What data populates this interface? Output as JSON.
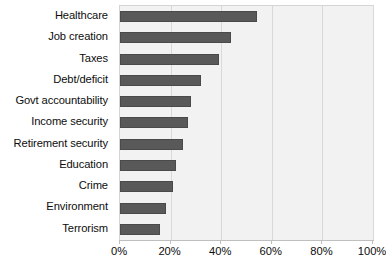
{
  "chart_data": {
    "type": "bar",
    "orientation": "horizontal",
    "title": "",
    "subtitle": "",
    "xlabel": "",
    "ylabel": "",
    "xlim": [
      0,
      100
    ],
    "xticks": [
      0,
      20,
      40,
      60,
      80,
      100
    ],
    "xtick_labels": [
      "0%",
      "20%",
      "40%",
      "60%",
      "80%",
      "100%"
    ],
    "grid": true,
    "grid_axis": "x",
    "legend": false,
    "legend_position": "none",
    "categories": [
      "Healthcare",
      "Job creation",
      "Taxes",
      "Debt/deficit",
      "Govt accountability",
      "Income security",
      "Retirement security",
      "Education",
      "Crime",
      "Environment",
      "Terrorism"
    ],
    "values": [
      54,
      44,
      39,
      32,
      28,
      27,
      25,
      22,
      21,
      18,
      16
    ],
    "series": [
      {
        "name": "",
        "values": [
          54,
          44,
          39,
          32,
          28,
          27,
          25,
          22,
          21,
          18,
          16
        ]
      }
    ]
  },
  "style": {
    "bar_color": "#595959",
    "bar_border_color": "#4a4a4a",
    "plot_background": "#f2f2f2",
    "plot_border": "#d4d4d4",
    "gridline_color": "#d9d9d9",
    "axis_color": "#bfbfbf",
    "text_color": "#0d0d0d",
    "page_background": "#ffffff"
  }
}
